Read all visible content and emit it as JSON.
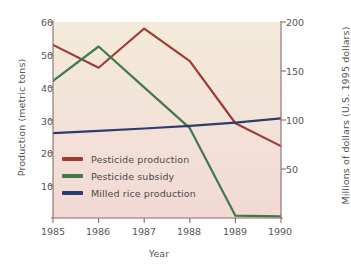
{
  "chart_data": {
    "type": "line",
    "title": "",
    "xlabel": "Year",
    "ylabel": "Production (metric tons)",
    "ylabel_right": "Millions of dollars (U.S. 1995 dollars)",
    "x": [
      1985,
      1986,
      1987,
      1988,
      1989,
      1990
    ],
    "xtick_labels": [
      "1985",
      "1986",
      "1987",
      "1988",
      "1989",
      "1990"
    ],
    "xlim": [
      1985,
      1990
    ],
    "ylim": [
      0,
      60
    ],
    "ytick_labels": [
      "60",
      "50",
      "40",
      "30",
      "20",
      "10"
    ],
    "ytick_values": [
      60,
      50,
      40,
      30,
      20,
      10
    ],
    "ylim_right": [
      0,
      200
    ],
    "ytick_labels_right": [
      "200",
      "150",
      "100",
      "50"
    ],
    "ytick_values_right": [
      200,
      150,
      100,
      50
    ],
    "grid": false,
    "legend_position": "lower-left-inside",
    "series": [
      {
        "name": "Pesticide production",
        "axis": "left",
        "color": "#9e3b34",
        "values": [
          53,
          46,
          58,
          48,
          29,
          22
        ]
      },
      {
        "name": "Pesticide subsidy",
        "axis": "left",
        "color": "#3e7a4e",
        "values": [
          42,
          52.5,
          40,
          27.5,
          0.7,
          0.5
        ]
      },
      {
        "name": "Milled rice production",
        "axis": "left",
        "color": "#2e3b6e",
        "values": [
          26,
          26.7,
          27.4,
          28.2,
          29.2,
          30.5
        ]
      }
    ]
  },
  "legend": {
    "items": [
      {
        "label": "Pesticide production",
        "color": "#9e3b34"
      },
      {
        "label": "Pesticide subsidy",
        "color": "#3e7a4e"
      },
      {
        "label": "Milled rice production",
        "color": "#2e3b6e"
      }
    ]
  },
  "axes": {
    "left_title": "Production (metric tons)",
    "right_title": "Millions of dollars (U.S. 1995 dollars)",
    "bottom_title": "Year"
  },
  "colors": {
    "pesticide_production": "#9e3b34",
    "pesticide_subsidy": "#3e7a4e",
    "milled_rice_production": "#2e3b6e",
    "plot_background_top": "#f3ead9",
    "plot_background_bottom": "#f2d9d4",
    "axis_line": "#8a6a6a",
    "text": "#4a4a4a"
  }
}
